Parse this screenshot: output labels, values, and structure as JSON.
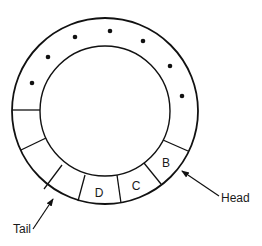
{
  "diagram": {
    "type": "circular-buffer",
    "slots": [
      {
        "label": "B",
        "x": 166,
        "y": 167
      },
      {
        "label": "C",
        "x": 136,
        "y": 190
      },
      {
        "label": "D",
        "x": 99,
        "y": 197
      }
    ],
    "pointers": {
      "head": {
        "label": "Head"
      },
      "tail": {
        "label": "Tail"
      }
    },
    "ellipsis_dot_count": 7,
    "colors": {
      "stroke": "#111111",
      "background": "#ffffff"
    }
  }
}
